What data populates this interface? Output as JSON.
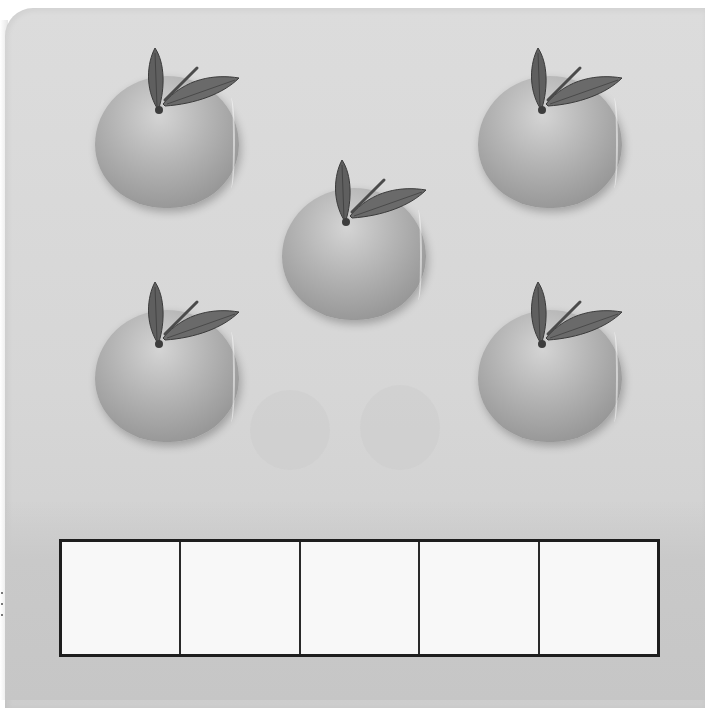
{
  "worksheet": {
    "description": "Counting worksheet with oranges and a ten-frame style answer grid",
    "objects": [
      {
        "type": "orange",
        "left": 95,
        "top": 70
      },
      {
        "type": "orange",
        "left": 282,
        "top": 182
      },
      {
        "type": "orange",
        "left": 478,
        "top": 70
      },
      {
        "type": "orange",
        "left": 95,
        "top": 304
      },
      {
        "type": "orange",
        "left": 478,
        "top": 304
      }
    ],
    "object_count": 5,
    "answer_frame": {
      "cells": 5,
      "filled": 0
    },
    "colors": {
      "background": "#d8d8d8",
      "frame_border": "#1e1e1e",
      "cell_fill": "#f8f8f8",
      "fruit": "#aaaaaa",
      "leaf": "#5a5a5a"
    }
  }
}
